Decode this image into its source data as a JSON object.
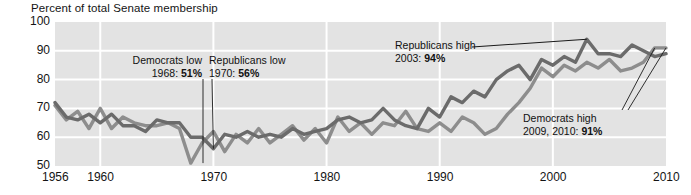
{
  "chart_data": {
    "type": "line",
    "title": "",
    "ylabel": "Percent of total Senate membership",
    "xlabel": "",
    "ylim": [
      50,
      100
    ],
    "xlim": [
      1956,
      2010
    ],
    "yticks": [
      100,
      90,
      80,
      70,
      60,
      50
    ],
    "xticks": [
      1956,
      1960,
      1970,
      1980,
      1990,
      2000,
      2010
    ],
    "grid": true,
    "legend_position": "none",
    "x": [
      1956,
      1957,
      1958,
      1959,
      1960,
      1961,
      1962,
      1963,
      1964,
      1965,
      1966,
      1967,
      1968,
      1969,
      1970,
      1971,
      1972,
      1973,
      1974,
      1975,
      1976,
      1977,
      1978,
      1979,
      1980,
      1981,
      1982,
      1983,
      1984,
      1985,
      1986,
      1987,
      1988,
      1989,
      1990,
      1991,
      1992,
      1993,
      1994,
      1995,
      1996,
      1997,
      1998,
      1999,
      2000,
      2001,
      2002,
      2003,
      2004,
      2005,
      2006,
      2007,
      2008,
      2009,
      2010
    ],
    "series": [
      {
        "name": "Democrats",
        "color": "#8d8d8d",
        "values": [
          71,
          66,
          69,
          63,
          70,
          63,
          67,
          65,
          64,
          64,
          65,
          63,
          51,
          58,
          62,
          55,
          61,
          58,
          63,
          58,
          61,
          64,
          59,
          63,
          58,
          67,
          62,
          65,
          61,
          65,
          64,
          69,
          63,
          62,
          65,
          62,
          67,
          65,
          61,
          63,
          68,
          72,
          77,
          84,
          81,
          85,
          83,
          86,
          84,
          87,
          83,
          84,
          86,
          91,
          91
        ]
      },
      {
        "name": "Republicans",
        "color": "#6b6b6b",
        "values": [
          72,
          67,
          66,
          68,
          65,
          68,
          64,
          64,
          62,
          66,
          65,
          65,
          60,
          60,
          56,
          61,
          60,
          62,
          60,
          61,
          60,
          63,
          61,
          62,
          63,
          66,
          67,
          65,
          66,
          70,
          66,
          64,
          63,
          70,
          67,
          74,
          72,
          76,
          74,
          80,
          83,
          85,
          80,
          87,
          85,
          88,
          86,
          94,
          89,
          89,
          88,
          92,
          90,
          88,
          89
        ]
      }
    ],
    "annotations": [
      {
        "id": "democrats-low",
        "line1": "Democrats low",
        "line2_prefix": "1968: ",
        "line2_value": "51%"
      },
      {
        "id": "republicans-low",
        "line1": "Republicans low",
        "line2_prefix": "1970: ",
        "line2_value": "56%"
      },
      {
        "id": "republicans-high",
        "line1": "Republicans high",
        "line2_prefix": "2003: ",
        "line2_value": "94%"
      },
      {
        "id": "democrats-high",
        "line1": "Democrats high",
        "line2_prefix": "2009, 2010: ",
        "line2_value": "91%"
      }
    ],
    "colors": {
      "plot_background": "#e3e3e3",
      "gridline": "#ffffff",
      "democrats_line": "#8d8d8d",
      "republicans_line": "#6b6b6b",
      "text": "#141414"
    }
  }
}
